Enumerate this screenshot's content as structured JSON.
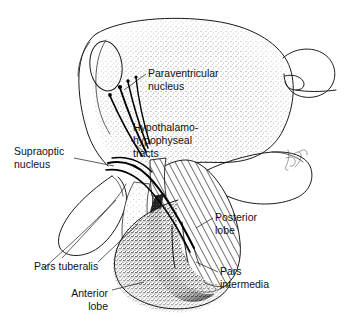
{
  "figure": {
    "style": "black-and-white pen-and-ink line drawing with stipple and hatch shading",
    "signature": "artist signature (cursive, illegible)"
  },
  "colors": {
    "ink": "#1a1a1a",
    "background": "#ffffff",
    "stipple_gray": "#8a8a8a",
    "dark_band": "#1c1c1c",
    "hatch": "#222222"
  },
  "labels": [
    {
      "id": "paraventricular-nucleus",
      "lines": [
        "Paraventricular",
        "nucleus"
      ],
      "align": "start",
      "x": 148,
      "y": 77
    },
    {
      "id": "hypothalamo-hypophyseal-tracts",
      "lines": [
        "Hypothalamo-",
        "hypophyseal",
        "tracts"
      ],
      "align": "start",
      "x": 133,
      "y": 131
    },
    {
      "id": "supraoptic-nucleus",
      "lines": [
        "Supraoptic",
        "nucleus"
      ],
      "align": "start",
      "x": 14,
      "y": 155
    },
    {
      "id": "posterior-lobe",
      "lines": [
        "Posterior",
        "lobe"
      ],
      "align": "start",
      "x": 215,
      "y": 221
    },
    {
      "id": "pars-tuberalis",
      "lines": [
        "Pars tuberalis"
      ],
      "align": "start",
      "x": 34,
      "y": 270
    },
    {
      "id": "pars-intermedia",
      "lines": [
        "Pars",
        "intermedia"
      ],
      "align": "start",
      "x": 220,
      "y": 275
    },
    {
      "id": "anterior-lobe",
      "lines": [
        "Anterior",
        "lobe"
      ],
      "align": "end",
      "x": 108,
      "y": 297
    }
  ],
  "structures": [
    {
      "id": "hypothalamus-body",
      "name": "hypothalamus / third ventricle wall",
      "shading": "stipple"
    },
    {
      "id": "anterior-commissure",
      "name": "anterior commissure oval",
      "shading": "outline"
    },
    {
      "id": "optic-chiasm",
      "name": "optic chiasm",
      "shading": "outline"
    },
    {
      "id": "mammillary-body",
      "name": "mammillary / midbrain bulb",
      "shading": "outline"
    },
    {
      "id": "infundibular-stalk",
      "name": "infundibular stalk",
      "shading": "hatch"
    },
    {
      "id": "posterior-lobe-mass",
      "name": "posterior lobe (neurohypophysis)",
      "shading": "hatch"
    },
    {
      "id": "pars-intermedia-band",
      "name": "pars intermedia",
      "shading": "dark-stipple-band"
    },
    {
      "id": "anterior-lobe-mass",
      "name": "anterior lobe (adenohypophysis)",
      "shading": "stipple"
    },
    {
      "id": "pars-tuberalis-band",
      "name": "pars tuberalis",
      "shading": "light-stipple"
    },
    {
      "id": "paraventricular-fibers",
      "name": "paraventricular neuron fibers",
      "shading": "solid-line"
    },
    {
      "id": "supraoptic-fibers",
      "name": "supraoptic neuron fibers",
      "shading": "solid-line"
    }
  ]
}
